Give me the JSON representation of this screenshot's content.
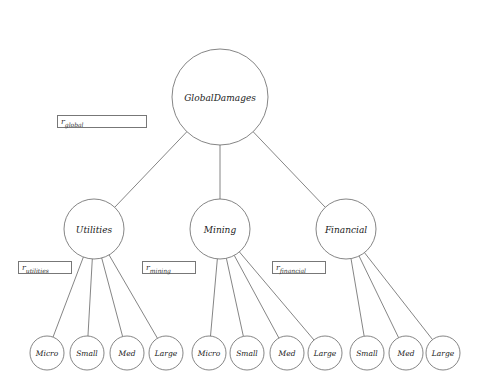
{
  "diagram": {
    "root": {
      "label": "GlobalDamages",
      "cx": 220,
      "cy": 97,
      "r": 48
    },
    "sectors": [
      {
        "label": "Utilities",
        "cx": 94,
        "cy": 229,
        "r": 30,
        "param_symbol": "r",
        "param_sub": "utilities",
        "box": {
          "x": 18,
          "y": 261,
          "w": 54
        },
        "children": [
          {
            "label": "Micro",
            "cx": 47,
            "cy": 353
          },
          {
            "label": "Small",
            "cx": 87,
            "cy": 353
          },
          {
            "label": "Med",
            "cx": 127,
            "cy": 353
          },
          {
            "label": "Large",
            "cx": 166,
            "cy": 353
          }
        ]
      },
      {
        "label": "Mining",
        "cx": 220,
        "cy": 229,
        "r": 30,
        "param_symbol": "r",
        "param_sub": "mining",
        "box": {
          "x": 142,
          "y": 261,
          "w": 54
        },
        "children": [
          {
            "label": "Micro",
            "cx": 209,
            "cy": 353
          },
          {
            "label": "Small",
            "cx": 247,
            "cy": 353
          },
          {
            "label": "Med",
            "cx": 287,
            "cy": 353
          },
          {
            "label": "Large",
            "cx": 325,
            "cy": 353
          }
        ]
      },
      {
        "label": "Financial",
        "cx": 346,
        "cy": 229,
        "r": 30,
        "param_symbol": "r",
        "param_sub": "financial",
        "box": {
          "x": 272,
          "y": 261,
          "w": 54
        },
        "children": [
          {
            "label": "Small",
            "cx": 367,
            "cy": 353
          },
          {
            "label": "Med",
            "cx": 406,
            "cy": 353
          },
          {
            "label": "Large",
            "cx": 443,
            "cy": 353
          }
        ]
      }
    ],
    "global_param": {
      "symbol": "r",
      "sub": "global",
      "box": {
        "x": 57,
        "y": 115,
        "w": 90
      }
    },
    "leaf_radius": 17,
    "stroke_color": "#666666"
  }
}
